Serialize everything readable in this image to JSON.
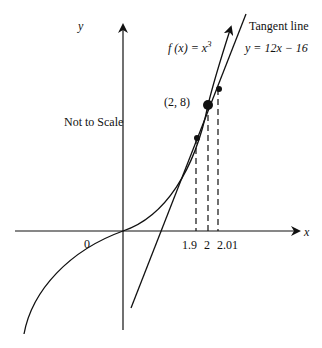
{
  "figure": {
    "axes": {
      "x_label": "x",
      "y_label": "y",
      "origin_label": "0"
    },
    "function_label": {
      "prefix": "f (x) = x",
      "exponent": "3"
    },
    "tangent": {
      "title": "Tangent line",
      "equation": "y = 12x − 16"
    },
    "point_label": "(2, 8)",
    "note": "Not to Scale",
    "x_ticks": [
      "1.9",
      "2",
      "2.01"
    ],
    "colors": {
      "stroke": "#111111",
      "background": "#ffffff"
    }
  }
}
